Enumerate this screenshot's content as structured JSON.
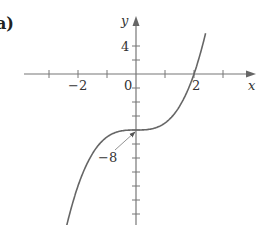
{
  "panel_label": "a)",
  "chart_data": {
    "type": "line",
    "title": "",
    "function": "y = x^3 - 8",
    "xlabel": "x",
    "ylabel": "y",
    "xlim": [
      -4,
      4.3
    ],
    "ylim": [
      -14,
      10
    ],
    "x_tick_labels": [
      {
        "value": -2,
        "label": "−2"
      },
      {
        "value": 0,
        "label": "0"
      },
      {
        "value": 2,
        "label": "2"
      }
    ],
    "y_tick_labels": [
      {
        "value": 4,
        "label": "4"
      }
    ],
    "x_ticks": [
      -3,
      -2,
      -1,
      1,
      2,
      3
    ],
    "y_ticks": [
      4,
      2,
      -2,
      -4,
      -6,
      -8,
      -10,
      -12,
      -14,
      -16,
      -18,
      -20
    ],
    "annotations": [
      {
        "text": "−8",
        "points_to": [
          0,
          -8
        ]
      }
    ],
    "x": [
      -2.4,
      -2.0,
      -1.5,
      -1.0,
      -0.5,
      0,
      0.5,
      1.0,
      1.5,
      2.0,
      2.4
    ],
    "y": [
      -21.8,
      -16,
      -11.4,
      -9,
      -8.1,
      -8,
      -7.9,
      -7,
      -4.6,
      0,
      5.8
    ],
    "grid": false
  }
}
